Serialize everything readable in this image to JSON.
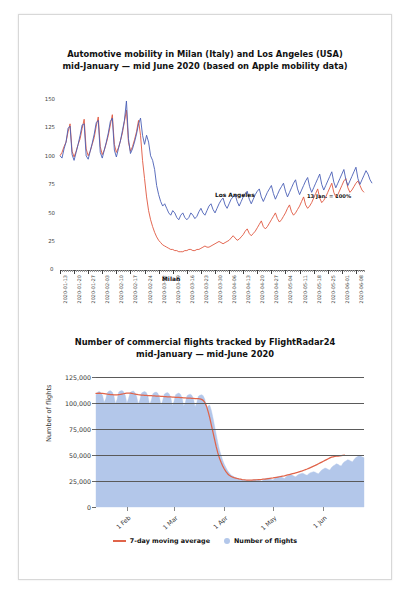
{
  "figure1": {
    "title_line1": "Automotive mobility in Milan (Italy) and Los Angeles (USA)",
    "title_line2": "mid-January — mid June 2020 (based on Apple mobility data)",
    "annotation": "13 Jan. = 100%",
    "label_la": "Los Angeles",
    "label_milan": "Milan",
    "zero_label": "0",
    "colors": {
      "los_angeles": "#4a5fb5",
      "milan": "#e0573f"
    },
    "chart_data": {
      "type": "line",
      "title": "Automotive mobility in Milan (Italy) and Los Angeles (USA) mid-January — mid June 2020 (based on Apple mobility data)",
      "xlabel": "",
      "ylabel": "",
      "ylim": [
        0,
        155
      ],
      "yticks": [
        25,
        50,
        75,
        100,
        125,
        150
      ],
      "grid": false,
      "legend": "inline-labels",
      "xticklabels": [
        "2020-01-13",
        "2020-01-20",
        "2020-01-27",
        "2020-02-03",
        "2020-02-10",
        "2020-02-17",
        "2020-02-24",
        "2020-03-02",
        "2020-03-09",
        "2020-03-16",
        "2020-03-23",
        "2020-03-30",
        "2020-04-06",
        "2020-04-13",
        "2020-04-20",
        "2020-04-27",
        "2020-05-04",
        "2020-05-11",
        "2020-05-18",
        "2020-05-25",
        "2020-06-01",
        "2020-06-08"
      ],
      "x_start": "2020-01-13",
      "x_end": "2020-06-13",
      "series": [
        {
          "name": "Milan",
          "color": "#e0573f",
          "values": [
            100,
            103,
            108,
            112,
            121,
            128,
            104,
            99,
            104,
            110,
            115,
            124,
            132,
            106,
            100,
            104,
            110,
            116,
            126,
            134,
            108,
            101,
            105,
            111,
            118,
            127,
            136,
            110,
            103,
            107,
            113,
            120,
            130,
            140,
            112,
            104,
            108,
            114,
            121,
            131,
            118,
            96,
            80,
            64,
            52,
            44,
            38,
            33,
            29,
            26,
            24,
            22,
            21,
            20,
            19,
            18,
            18,
            17,
            17,
            16,
            16,
            16,
            17,
            17,
            18,
            18,
            17,
            17,
            18,
            18,
            19,
            20,
            21,
            20,
            20,
            21,
            22,
            23,
            24,
            25,
            24,
            23,
            24,
            25,
            26,
            28,
            30,
            28,
            26,
            27,
            29,
            31,
            34,
            36,
            32,
            30,
            32,
            34,
            37,
            40,
            43,
            38,
            36,
            38,
            41,
            44,
            47,
            50,
            45,
            42,
            44,
            47,
            50,
            54,
            57,
            51,
            48,
            50,
            53,
            56,
            60,
            64,
            57,
            54,
            56,
            59,
            63,
            67,
            71,
            63,
            59,
            61,
            64,
            68,
            72,
            76,
            68,
            64,
            66,
            70,
            74,
            78,
            80,
            72,
            68,
            70,
            73,
            76,
            78,
            74,
            70,
            68
          ]
        },
        {
          "name": "Los Angeles",
          "color": "#4a5fb5",
          "values": [
            100,
            98,
            106,
            112,
            124,
            126,
            101,
            96,
            103,
            110,
            118,
            127,
            128,
            100,
            97,
            104,
            111,
            119,
            129,
            131,
            103,
            98,
            105,
            112,
            120,
            130,
            133,
            105,
            99,
            106,
            113,
            122,
            131,
            148,
            115,
            102,
            106,
            112,
            119,
            128,
            133,
            118,
            110,
            118,
            112,
            100,
            96,
            88,
            74,
            66,
            60,
            56,
            58,
            54,
            50,
            48,
            52,
            50,
            46,
            44,
            48,
            50,
            46,
            44,
            46,
            50,
            48,
            45,
            47,
            51,
            54,
            50,
            48,
            52,
            56,
            58,
            53,
            50,
            54,
            58,
            61,
            63,
            57,
            54,
            58,
            62,
            64,
            66,
            60,
            56,
            60,
            64,
            67,
            69,
            62,
            58,
            62,
            66,
            69,
            71,
            64,
            60,
            64,
            68,
            71,
            74,
            67,
            62,
            66,
            70,
            73,
            76,
            69,
            64,
            68,
            72,
            76,
            79,
            71,
            66,
            70,
            74,
            78,
            81,
            73,
            68,
            72,
            76,
            80,
            84,
            75,
            70,
            74,
            78,
            82,
            86,
            77,
            72,
            76,
            80,
            84,
            88,
            79,
            74,
            78,
            82,
            86,
            90,
            80,
            75,
            79,
            83,
            87,
            84,
            79,
            76
          ]
        }
      ]
    }
  },
  "figure2": {
    "title_line1": "Number of commercial flights tracked by FlightRadar24",
    "title_line2": "mid-January — mid-June 2020",
    "axis_title": "Number of flights",
    "legend": [
      {
        "label": "7-day moving average",
        "marker": "line",
        "color": "#e0644a"
      },
      {
        "label": "Number of flights",
        "marker": "dot",
        "color": "#b3c7ea"
      }
    ],
    "chart_data": {
      "type": "area",
      "title": "Number of commercial flights tracked by FlightRadar24 mid-January — mid-June 2020",
      "xlabel": "",
      "ylabel": "Number of flights",
      "ylim": [
        0,
        125000
      ],
      "yticks": [
        0,
        25000,
        50000,
        75000,
        100000,
        125000
      ],
      "yticklabels": [
        "0",
        "25,000",
        "50,000",
        "75,000",
        "100,000",
        "125,000"
      ],
      "xticklabels": [
        "1 Feb",
        "1 Mar",
        "1 Apr",
        "1 May",
        "1 Jun"
      ],
      "grid": true,
      "series": [
        {
          "name": "Number of flights",
          "color": "#b3c7ea",
          "values": [
            108000,
            110500,
            111000,
            110000,
            107500,
            100500,
            104000,
            110000,
            111500,
            111800,
            110500,
            107000,
            99500,
            103500,
            110500,
            111500,
            112000,
            110800,
            107500,
            100000,
            104000,
            110000,
            111000,
            111500,
            110000,
            106500,
            99000,
            103000,
            109500,
            110500,
            111000,
            110000,
            106500,
            98500,
            102500,
            109000,
            110000,
            110500,
            109500,
            106000,
            98000,
            102000,
            108500,
            109500,
            110000,
            109000,
            105500,
            97500,
            101500,
            108000,
            109000,
            109500,
            108500,
            105000,
            97000,
            100500,
            107000,
            108000,
            108500,
            107500,
            104000,
            96500,
            100000,
            106500,
            107500,
            108000,
            107000,
            103500,
            95000,
            97000,
            98000,
            93000,
            86000,
            78000,
            70000,
            62000,
            55000,
            50000,
            45000,
            41000,
            38000,
            35000,
            33000,
            31000,
            30000,
            29000,
            28200,
            27800,
            27000,
            26500,
            26200,
            26000,
            25800,
            25500,
            25200,
            25000,
            25500,
            26000,
            26200,
            26500,
            26000,
            25500,
            25000,
            26000,
            27000,
            27500,
            27800,
            27200,
            26500,
            26000,
            27500,
            28500,
            29000,
            29500,
            29000,
            28200,
            27500,
            29000,
            30000,
            30500,
            31000,
            30500,
            29500,
            29000,
            30500,
            31500,
            32000,
            32500,
            32000,
            31000,
            30500,
            32000,
            33000,
            33500,
            34000,
            33500,
            32500,
            32000,
            34000,
            35500,
            36500,
            37500,
            37000,
            36000,
            35500,
            38000,
            39500,
            40500,
            41500,
            41000,
            40000,
            39500,
            42000,
            43500,
            44500,
            45500,
            45000,
            44000,
            43500,
            46000,
            47500,
            48500,
            49500,
            49000,
            48000,
            47500
          ]
        },
        {
          "name": "7-day moving average",
          "color": "#e0644a",
          "values": [
            109200,
            109300,
            109400,
            109300,
            109200,
            109000,
            108800,
            108500,
            108300,
            108100,
            108000,
            107900,
            107800,
            107900,
            108100,
            108300,
            108600,
            108900,
            109200,
            109400,
            109500,
            109400,
            109200,
            108900,
            108600,
            108300,
            108000,
            107800,
            107600,
            107500,
            107400,
            107300,
            107200,
            107100,
            107000,
            106900,
            106800,
            106700,
            106600,
            106500,
            106400,
            106300,
            106200,
            106100,
            106000,
            105900,
            105800,
            105700,
            105600,
            105500,
            105400,
            105300,
            105200,
            105100,
            105000,
            104900,
            104800,
            104700,
            104600,
            104500,
            104400,
            104300,
            104200,
            104100,
            104000,
            103500,
            102500,
            100500,
            97000,
            92000,
            86000,
            79000,
            72000,
            65000,
            58000,
            52000,
            47000,
            43000,
            39500,
            36500,
            34000,
            32000,
            30500,
            29500,
            28800,
            28200,
            27800,
            27400,
            27000,
            26700,
            26400,
            26200,
            26000,
            25900,
            25800,
            25800,
            25900,
            26000,
            26100,
            26200,
            26300,
            26400,
            26500,
            26700,
            26900,
            27100,
            27300,
            27500,
            27700,
            27900,
            28200,
            28500,
            28800,
            29100,
            29400,
            29700,
            30000,
            30400,
            30800,
            31200,
            31600,
            32000,
            32400,
            32800,
            33200,
            33700,
            34200,
            34700,
            35300,
            35900,
            36500,
            37200,
            37900,
            38600,
            39300,
            40000,
            40800,
            41600,
            42400,
            43200,
            44000,
            44800,
            45600,
            46400,
            47200,
            48000,
            48300,
            48600,
            48800,
            49000,
            49200,
            49400,
            49600,
            49800
          ]
        }
      ]
    }
  }
}
